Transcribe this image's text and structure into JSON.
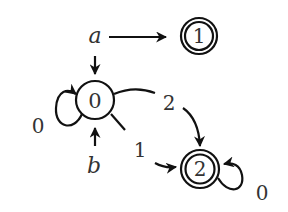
{
  "diagram": {
    "type": "finite-automaton",
    "states": [
      {
        "id": "0",
        "label": "0",
        "accepting": false
      },
      {
        "id": "1",
        "label": "1",
        "accepting": true
      },
      {
        "id": "2",
        "label": "2",
        "accepting": true
      }
    ],
    "initial_markers": [
      {
        "label": "a",
        "targets": [
          "1",
          "0"
        ]
      },
      {
        "label": "b",
        "targets": [
          "0"
        ]
      }
    ],
    "transitions": [
      {
        "from": "0",
        "to": "0",
        "label": "0"
      },
      {
        "from": "0",
        "to": "2",
        "label": "2"
      },
      {
        "from": "0",
        "to": "2",
        "label": "1"
      },
      {
        "from": "2",
        "to": "2",
        "label": "0"
      }
    ],
    "colors": {
      "stroke": "#111111",
      "text": "#333333",
      "background": "#ffffff"
    }
  }
}
